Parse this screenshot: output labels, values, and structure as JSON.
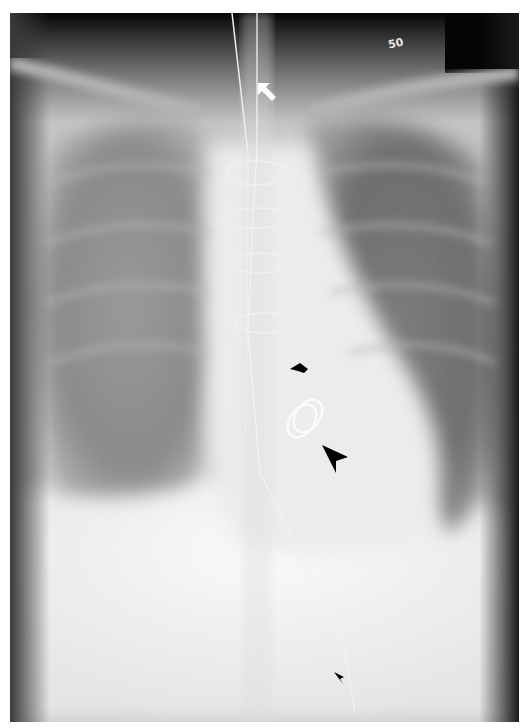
{
  "image": {
    "kind": "frontal chest radiograph",
    "film_marker_text": "50",
    "annotations": [
      {
        "id": "white-arrow",
        "color": "#ffffff",
        "direction": "up-left",
        "points_to": "tube tip in upper trachea"
      },
      {
        "id": "black-arrow-short",
        "color": "#000000",
        "direction": "left",
        "points_to": "prosthetic valve region"
      },
      {
        "id": "black-arrowhead-large",
        "color": "#000000",
        "direction": "up-left",
        "points_to": "prosthetic valve ring"
      },
      {
        "id": "black-arrowhead-small",
        "color": "#000000",
        "direction": "up-left",
        "points_to": "catheter in abdomen"
      }
    ],
    "colors": {
      "border": "#ffffff",
      "dark_region": "#050505",
      "soft_tissue": "#d8d8d8",
      "bright_region": "#f6f6f6"
    }
  }
}
